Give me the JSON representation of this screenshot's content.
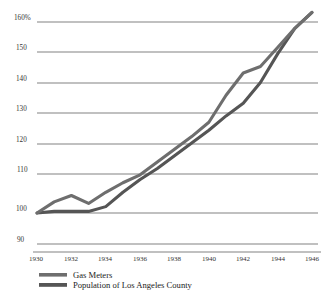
{
  "chart_data": {
    "type": "line",
    "title": "",
    "subtitle": "",
    "xlabel": "",
    "ylabel": "",
    "grid": true,
    "legend_position": "bottom-left",
    "xlim": [
      1930,
      1946
    ],
    "ylim": [
      90,
      163
    ],
    "y_ticks": [
      "160%",
      "150",
      "140",
      "130",
      "120",
      "110",
      "100",
      "90"
    ],
    "y_tick_values": [
      160,
      150,
      140,
      130,
      120,
      110,
      100,
      90
    ],
    "x_ticks": [
      "1930",
      "1932",
      "1934",
      "1936",
      "1938",
      "1940",
      "1942",
      "1944",
      "1946"
    ],
    "x_tick_values": [
      1930,
      1932,
      1934,
      1936,
      1938,
      1940,
      1942,
      1944,
      1946
    ],
    "x": [
      1930,
      1931,
      1932,
      1933,
      1934,
      1935,
      1936,
      1937,
      1938,
      1939,
      1940,
      1941,
      1942,
      1943,
      1944,
      1945,
      1946
    ],
    "series": [
      {
        "name": "Gas Meters",
        "color": "#6e6e6e",
        "values": [
          100.0,
          103.5,
          105.5,
          103.0,
          106.5,
          109.5,
          112.0,
          116.0,
          120.0,
          124.0,
          128.5,
          137.0,
          144.0,
          146.0,
          152.0,
          158.0,
          163.0
        ]
      },
      {
        "name": "Population of Los Angeles County",
        "color": "#555555",
        "values": [
          100.0,
          100.5,
          100.5,
          100.5,
          102.0,
          106.5,
          110.5,
          114.0,
          118.0,
          122.0,
          126.0,
          130.5,
          134.5,
          141.0,
          150.0,
          158.0,
          163.0
        ]
      }
    ]
  },
  "legend": {
    "items": [
      {
        "label": "Gas Meters",
        "color": "#6e6e6e"
      },
      {
        "label": "Population of Los Angeles County",
        "color": "#555555"
      }
    ]
  },
  "yticks": {
    "t0": "160%",
    "t1": "150",
    "t2": "140",
    "t3": "130",
    "t4": "120",
    "t5": "110",
    "t6": "100",
    "t7": "90"
  },
  "xticks": {
    "t0": "1930",
    "t1": "1932",
    "t2": "1934",
    "t3": "1936",
    "t4": "1938",
    "t5": "1940",
    "t6": "1942",
    "t7": "1944",
    "t8": "1946"
  }
}
